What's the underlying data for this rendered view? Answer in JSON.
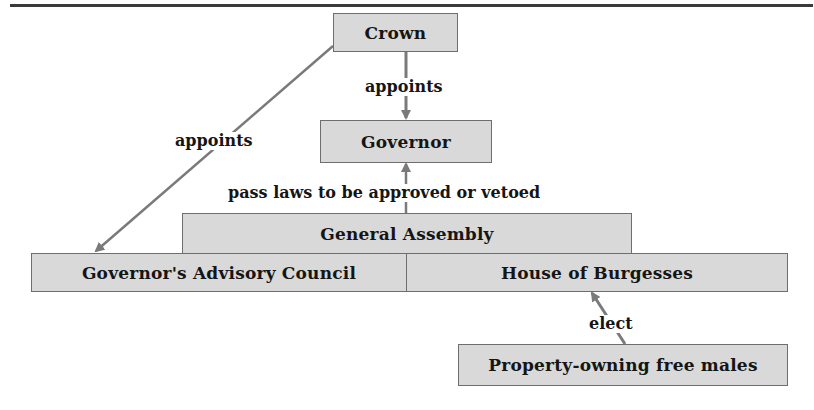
{
  "diagram": {
    "type": "hierarchy",
    "colors": {
      "box_fill": "#d9d9d9",
      "box_border": "#6e6e6e",
      "arrow": "#7a7a7a",
      "text": "#151515"
    },
    "nodes": {
      "crown": "Crown",
      "governor": "Governor",
      "general_assembly": "General Assembly",
      "advisory_council": "Governor's Advisory Council",
      "house_of_burgesses": "House of Burgesses",
      "free_males": "Property-owning free males"
    },
    "edges": {
      "crown_to_governor": "appoints",
      "crown_to_council": "appoints",
      "assembly_to_governor": "pass laws to be approved or vetoed",
      "males_to_burgesses": "elect"
    }
  }
}
